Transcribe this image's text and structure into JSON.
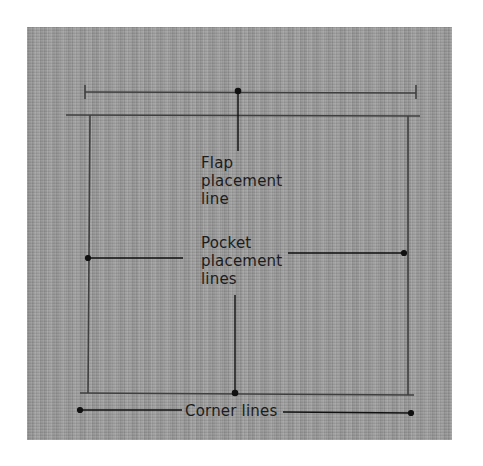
{
  "figure": {
    "background_color": "#9b9b9b",
    "line_color": "#3a3a3a",
    "leader_color": "#111111",
    "labels": {
      "flap": [
        "Flap",
        "placement",
        "line"
      ],
      "pocket": [
        "Pocket",
        "placement",
        "lines"
      ],
      "corner": "Corner lines"
    }
  }
}
